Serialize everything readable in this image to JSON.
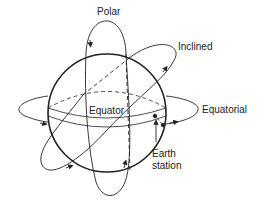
{
  "diagram": {
    "labels": {
      "polar": "Polar",
      "inclined": "Inclined",
      "equatorial": "Equatorial",
      "equator": "Equator",
      "earth_station_line1": "Earth",
      "earth_station_line2": "station"
    },
    "colors": {
      "stroke": "#222222",
      "background": "#ffffff"
    }
  }
}
